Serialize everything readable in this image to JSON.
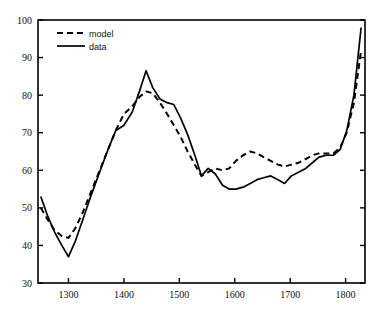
{
  "chart_data": {
    "type": "line",
    "title": "",
    "xlabel": "",
    "ylabel": "",
    "xlim": [
      1245,
      1835
    ],
    "ylim": [
      30,
      100
    ],
    "xticks": [
      1300,
      1400,
      1500,
      1600,
      1700,
      1800
    ],
    "yticks": [
      30,
      40,
      50,
      60,
      70,
      80,
      90,
      100
    ],
    "xtick_labels": [
      "1300",
      "1400",
      "1500",
      "1600",
      "1700",
      "1800"
    ],
    "ytick_labels": [
      "30",
      "40",
      "50",
      "60",
      "70",
      "80",
      "90",
      "100"
    ],
    "grid": false,
    "legend_position": "upper left",
    "series": [
      {
        "name": "model",
        "style": "dashed",
        "color": "#000000",
        "x": [
          1250,
          1262,
          1275,
          1288,
          1300,
          1312,
          1325,
          1340,
          1355,
          1370,
          1385,
          1400,
          1415,
          1428,
          1440,
          1452,
          1465,
          1478,
          1490,
          1502,
          1515,
          1528,
          1540,
          1552,
          1565,
          1578,
          1590,
          1602,
          1615,
          1628,
          1640,
          1652,
          1665,
          1678,
          1690,
          1702,
          1715,
          1728,
          1740,
          1752,
          1765,
          1778,
          1790,
          1802,
          1815,
          1828
        ],
        "y": [
          50.0,
          47.0,
          44.0,
          42.5,
          42.0,
          44.5,
          48.5,
          54.0,
          59.5,
          65.0,
          70.5,
          75.0,
          77.0,
          79.5,
          81.0,
          80.5,
          78.0,
          75.0,
          72.0,
          69.0,
          65.0,
          61.5,
          58.5,
          59.5,
          60.5,
          60.0,
          60.5,
          62.5,
          64.0,
          65.0,
          64.5,
          63.5,
          62.5,
          61.5,
          61.0,
          61.5,
          62.0,
          63.0,
          64.0,
          64.5,
          64.5,
          64.5,
          66.0,
          70.0,
          78.0,
          92.0
        ]
      },
      {
        "name": "data",
        "style": "solid",
        "color": "#000000",
        "x": [
          1250,
          1262,
          1275,
          1288,
          1300,
          1312,
          1325,
          1340,
          1355,
          1370,
          1385,
          1400,
          1415,
          1428,
          1440,
          1452,
          1465,
          1478,
          1490,
          1502,
          1515,
          1528,
          1540,
          1552,
          1565,
          1578,
          1590,
          1602,
          1615,
          1628,
          1640,
          1652,
          1665,
          1678,
          1690,
          1702,
          1715,
          1728,
          1740,
          1752,
          1765,
          1778,
          1790,
          1802,
          1815,
          1828
        ],
        "y": [
          53.0,
          48.0,
          43.5,
          40.0,
          37.0,
          41.0,
          46.5,
          53.0,
          59.0,
          65.0,
          70.5,
          72.0,
          75.5,
          81.0,
          86.5,
          82.0,
          79.0,
          78.0,
          77.5,
          74.0,
          69.5,
          64.0,
          58.5,
          60.5,
          59.0,
          56.0,
          55.0,
          55.0,
          55.5,
          56.5,
          57.5,
          58.0,
          58.5,
          57.5,
          56.5,
          58.5,
          59.5,
          60.5,
          62.0,
          63.5,
          64.0,
          64.0,
          65.5,
          70.5,
          80.0,
          98.0
        ]
      }
    ],
    "legend": [
      {
        "label": "model",
        "style": "dashed"
      },
      {
        "label": "data",
        "style": "solid"
      }
    ]
  }
}
